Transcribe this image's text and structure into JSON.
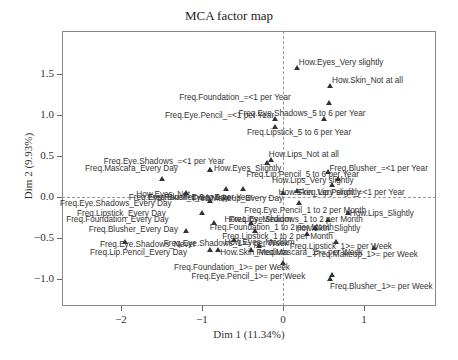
{
  "chart_data": {
    "type": "scatter",
    "title": "MCA factor map",
    "xlabel": "Dim 1 (11.34%)",
    "ylabel": "Dim 2 (9.93%)",
    "xlim": [
      -2.72,
      1.9
    ],
    "ylim": [
      -1.33,
      2.03
    ],
    "xticks": [
      -2,
      -1,
      0,
      1
    ],
    "yticks": [
      -1.0,
      -0.5,
      0.0,
      0.5,
      1.0,
      1.5
    ],
    "grid": false,
    "reference_lines": {
      "x": 0,
      "y": 0,
      "style": "dashed"
    },
    "points": [
      {
        "label": "How.Eyes_Very slightly",
        "x": 0.17,
        "y": 1.57,
        "lx": 2,
        "ly": -10
      },
      {
        "label": "How.Skin_Not at all",
        "x": 0.58,
        "y": 1.35,
        "lx": 2,
        "ly": -10
      },
      {
        "label": "Freq.Foundation_=<1 per Year",
        "x": 0.57,
        "y": 1.15,
        "lx": -150,
        "ly": -10
      },
      {
        "label": "Freq.Eye.Pencil_=<1 per Year",
        "x": -0.1,
        "y": 0.95,
        "lx": -110,
        "ly": -8
      },
      {
        "label": "Freq.Eye.Shadows_5 to 6 per Year",
        "x": 0.5,
        "y": 0.95,
        "lx": -85,
        "ly": -10
      },
      {
        "label": "Freq.Lipstick_5 to 6 per Year",
        "x": -0.1,
        "y": 0.85,
        "lx": -28,
        "ly": 1
      },
      {
        "label": "How.Lips_Not at all",
        "x": -0.15,
        "y": 0.45,
        "lx": -2,
        "ly": -10
      },
      {
        "label": "Freq.Eye.Shadows_=<1 per Year",
        "x": -0.2,
        "y": 0.42,
        "lx": -163,
        "ly": -6
      },
      {
        "label": "Freq.Blusher_=<1 per Year",
        "x": 0.55,
        "y": 0.3,
        "lx": 2,
        "ly": -8
      },
      {
        "label": "Freq.Mascara_Every Day",
        "x": -0.9,
        "y": 0.33,
        "lx": -125,
        "ly": -6
      },
      {
        "label": "How.Eyes_Slightly",
        "x": -0.9,
        "y": 0.33,
        "lx": 4,
        "ly": -6
      },
      {
        "label": "Freq.Lip.Pencil_5 to 6 per Year",
        "x": -1.5,
        "y": 0.22,
        "lx": 85,
        "ly": -9
      },
      {
        "label": "How.Lips_Very slightly",
        "x": 0.68,
        "y": 0.22,
        "lx": -66,
        "ly": -3
      },
      {
        "label": "How.Eyes_Not",
        "x": -0.7,
        "y": 0.1,
        "lx": -90,
        "ly": 1
      },
      {
        "label": "How.Skin_Very slightly",
        "x": 0.6,
        "y": 0.15,
        "lx": -53,
        "ly": 3
      },
      {
        "label": "Freq.Makeup_Every Day",
        "x": -0.5,
        "y": 0.1,
        "lx": -50,
        "ly": 5
      },
      {
        "label": "Freq.Eye.Pencil_Every Day",
        "x": -1.2,
        "y": 0.05,
        "lx": -57,
        "ly": 0
      },
      {
        "label": "Freq.Lip.Pencil_=<1 per Year",
        "x": 0.17,
        "y": 0.07,
        "lx": 2,
        "ly": -3
      },
      {
        "label": "Freq.Blusher_5 to 6 per Year",
        "x": 0.0,
        "y": 0.05,
        "lx": -135,
        "ly": 0
      },
      {
        "label": "Freq.Eye.Shadows_Every Day",
        "x": -0.9,
        "y": -0.05,
        "lx": -150,
        "ly": -2
      },
      {
        "label": "Freq.Eye.Pencil_1 to 2 per Month",
        "x": 0.2,
        "y": -0.07,
        "lx": -55,
        "ly": 3
      },
      {
        "label": "Freq.Lipstick_Every Day",
        "x": -1.0,
        "y": -0.2,
        "lx": -125,
        "ly": -4
      },
      {
        "label": "How.Lips_Slightly",
        "x": 0.8,
        "y": -0.2,
        "lx": 2,
        "ly": -4
      },
      {
        "label": "Freq.Foundation_Every Day",
        "x": -0.85,
        "y": -0.32,
        "lx": -148,
        "ly": -8
      },
      {
        "label": "How.Lips_Medium",
        "x": -0.4,
        "y": -0.32,
        "lx": -26,
        "ly": -8
      },
      {
        "label": "Freq.Eye.Shadows_1 to 2 per Month",
        "x": 0.55,
        "y": -0.28,
        "lx": -98,
        "ly": -5
      },
      {
        "label": "Freq.Blusher_Every Day",
        "x": -1.2,
        "y": -0.42,
        "lx": -97,
        "ly": -6
      },
      {
        "label": "Freq.Foundation_1 to 2 per Month",
        "x": -0.35,
        "y": -0.42,
        "lx": -45,
        "ly": -8
      },
      {
        "label": "How.Skin_Slightly",
        "x": 0.4,
        "y": -0.38,
        "lx": -20,
        "ly": -4
      },
      {
        "label": "How.Eyes_Medium",
        "x": -0.6,
        "y": -0.52,
        "lx": -10,
        "ly": -2
      },
      {
        "label": "Freq.Lipstick_1 to 2 per Month",
        "x": 0.3,
        "y": -0.45,
        "lx": -85,
        "ly": -2
      },
      {
        "label": "Freq.Eye.Shadows_Never",
        "x": -1.95,
        "y": -0.55,
        "lx": -25,
        "ly": -2
      },
      {
        "label": "Freq.Eye.Shadows_1>= per Week",
        "x": -0.3,
        "y": -0.6,
        "lx": -95,
        "ly": -7
      },
      {
        "label": "Freq.Lipstick_1>= per Week",
        "x": 0.65,
        "y": -0.55,
        "lx": -46,
        "ly": 0
      },
      {
        "label": "Freq.Lip.Pencil_Every Day",
        "x": -0.9,
        "y": -0.65,
        "lx": -120,
        "ly": -2
      },
      {
        "label": "How.Skin_Medium",
        "x": -0.8,
        "y": -0.65,
        "lx": 2,
        "ly": -2
      },
      {
        "label": "Freq.Mascara_1>= per Week",
        "x": -0.4,
        "y": -0.65,
        "lx": 6,
        "ly": -2
      },
      {
        "label": "Freq.Makeup_1>= per Week",
        "x": 1.12,
        "y": -0.62,
        "lx": -60,
        "ly": 2
      },
      {
        "label": "Freq.Foundation_1>= per Week",
        "x": 0.0,
        "y": -0.8,
        "lx": -109,
        "ly": 0
      },
      {
        "label": "Freq.Eye.Pencil_1>= per Week",
        "x": 0.6,
        "y": -0.95,
        "lx": -140,
        "ly": -3
      },
      {
        "label": "Freq.Blusher_1>= per Week",
        "x": 0.58,
        "y": -1.0,
        "lx": 0,
        "ly": 3
      }
    ]
  }
}
